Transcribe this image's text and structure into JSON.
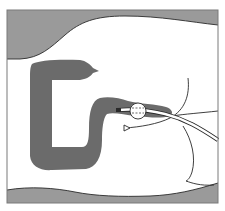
{
  "diagram": {
    "colors": {
      "background": "#ffffff",
      "body_wall": "#9a9a9a",
      "colon": "#6b6b6b",
      "outline": "#2a2a2a",
      "frame": "#7a7a7a",
      "catheter_fill": "#ffffff"
    },
    "elements": [
      {
        "id": "frame",
        "label": "Frame border"
      },
      {
        "id": "upper-body-wall",
        "label": "Upper body wall (shaded)"
      },
      {
        "id": "lower-body-wall",
        "label": "Lower body wall (shaded)"
      },
      {
        "id": "colon",
        "label": "Colon (dark shaded)"
      },
      {
        "id": "balloon",
        "label": "Inflated catheter balloon"
      },
      {
        "id": "catheter-tube",
        "label": "Catheter tube"
      },
      {
        "id": "anal-sphincter-lines",
        "label": "Buttock / anal outline curves"
      },
      {
        "id": "arrow-marker",
        "label": "Open arrowhead marker"
      }
    ]
  }
}
